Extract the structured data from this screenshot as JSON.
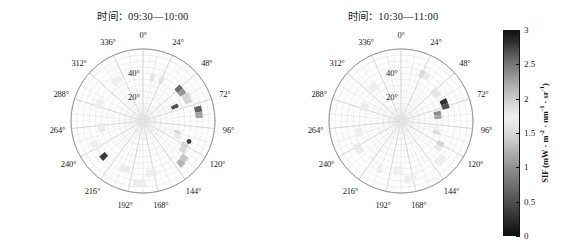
{
  "figure": {
    "background": "#ffffff",
    "panels": [
      {
        "id": "left",
        "title": "时间：09:30—10:00",
        "radial": {
          "labels": [
            "20°",
            "40°"
          ],
          "values": [
            20,
            40
          ],
          "max": 60,
          "rings": [
            5,
            10,
            15,
            20,
            25,
            30,
            35,
            40,
            45,
            50,
            55,
            60
          ]
        },
        "azimuth": {
          "labels": [
            "0°",
            "24°",
            "48°",
            "72°",
            "96°",
            "120°",
            "144°",
            "168°",
            "192°",
            "216°",
            "240°",
            "264°",
            "288°",
            "312°",
            "336°"
          ],
          "values": [
            0,
            24,
            48,
            72,
            96,
            120,
            144,
            168,
            192,
            216,
            240,
            264,
            288,
            312,
            336
          ],
          "spoke_step": 12
        },
        "marker": {
          "name": "hotspot-marker",
          "azimuth": 114,
          "zenith": 42,
          "color": "#404040"
        },
        "cells": [
          {
            "azimuth": 12,
            "zenith": 37,
            "value": 1.45
          },
          {
            "azimuth": 24,
            "zenith": 37,
            "value": 1.45
          },
          {
            "azimuth": 48,
            "zenith": 40,
            "value": 2.55
          },
          {
            "azimuth": 54,
            "zenith": 40,
            "value": 2.35
          },
          {
            "azimuth": 60,
            "zenith": 41,
            "value": 1.95
          },
          {
            "azimuth": 66,
            "zenith": 41,
            "value": 1.95
          },
          {
            "azimuth": 66,
            "zenith": 29,
            "value": 2.7
          },
          {
            "azimuth": 72,
            "zenith": 29,
            "value": 1.7
          },
          {
            "azimuth": 78,
            "zenith": 47,
            "value": 2.6
          },
          {
            "azimuth": 84,
            "zenith": 47,
            "value": 2.25
          },
          {
            "azimuth": 108,
            "zenith": 30,
            "value": 1.25
          },
          {
            "azimuth": 114,
            "zenith": 31,
            "value": 1.55
          },
          {
            "azimuth": 120,
            "zenith": 40,
            "value": 1.15
          },
          {
            "azimuth": 126,
            "zenith": 41,
            "value": 1.25
          },
          {
            "azimuth": 132,
            "zenith": 46,
            "value": 2.05
          },
          {
            "azimuth": 138,
            "zenith": 47,
            "value": 2.15
          },
          {
            "azimuth": 168,
            "zenith": 44,
            "value": 1.7
          },
          {
            "azimuth": 174,
            "zenith": 44,
            "value": 1.7
          },
          {
            "azimuth": 180,
            "zenith": 52,
            "value": 1.75
          },
          {
            "azimuth": 186,
            "zenith": 52,
            "value": 1.75
          },
          {
            "azimuth": 198,
            "zenith": 42,
            "value": 1.75
          },
          {
            "azimuth": 204,
            "zenith": 43,
            "value": 1.75
          },
          {
            "azimuth": 228,
            "zenith": 44,
            "value": 2.8
          },
          {
            "azimuth": 240,
            "zenith": 44,
            "value": 1.7
          },
          {
            "azimuth": 246,
            "zenith": 45,
            "value": 1.7
          },
          {
            "azimuth": 258,
            "zenith": 35,
            "value": 1.55
          },
          {
            "azimuth": 264,
            "zenith": 35,
            "value": 1.55
          },
          {
            "azimuth": 288,
            "zenith": 39,
            "value": 1.7
          },
          {
            "azimuth": 294,
            "zenith": 39,
            "value": 1.7
          },
          {
            "azimuth": 324,
            "zenith": 40,
            "value": 1.7
          },
          {
            "azimuth": 330,
            "zenith": 40,
            "value": 1.7
          }
        ]
      },
      {
        "id": "right",
        "title": "时间：10:30—11:00",
        "radial": {
          "labels": [
            "20°",
            "40°"
          ],
          "values": [
            20,
            40
          ],
          "max": 60,
          "rings": [
            5,
            10,
            15,
            20,
            25,
            30,
            35,
            40,
            45,
            50,
            55,
            60
          ]
        },
        "azimuth": {
          "labels": [
            "0°",
            "24°",
            "48°",
            "72°",
            "96°",
            "120°",
            "144°",
            "168°",
            "192°",
            "216°",
            "240°",
            "264°",
            "288°",
            "312°",
            "336°"
          ],
          "values": [
            0,
            24,
            48,
            72,
            96,
            120,
            144,
            168,
            192,
            216,
            240,
            264,
            288,
            312,
            336
          ],
          "spoke_step": 12
        },
        "marker": null,
        "cells": [
          {
            "azimuth": 24,
            "zenith": 43,
            "value": 1.9
          },
          {
            "azimuth": 30,
            "zenith": 43,
            "value": 1.55
          },
          {
            "azimuth": 48,
            "zenith": 37,
            "value": 1.45
          },
          {
            "azimuth": 54,
            "zenith": 37,
            "value": 1.45
          },
          {
            "azimuth": 66,
            "zenith": 39,
            "value": 2.85
          },
          {
            "azimuth": 72,
            "zenith": 39,
            "value": 2.7
          },
          {
            "azimuth": 78,
            "zenith": 31,
            "value": 2.4
          },
          {
            "azimuth": 84,
            "zenith": 31,
            "value": 2.25
          },
          {
            "azimuth": 102,
            "zenith": 30,
            "value": 1.65
          },
          {
            "azimuth": 108,
            "zenith": 31,
            "value": 1.9
          },
          {
            "azimuth": 120,
            "zenith": 38,
            "value": 1.2
          },
          {
            "azimuth": 126,
            "zenith": 38,
            "value": 1.55
          },
          {
            "azimuth": 132,
            "zenith": 46,
            "value": 1.7
          },
          {
            "azimuth": 138,
            "zenith": 46,
            "value": 1.7
          },
          {
            "azimuth": 168,
            "zenith": 49,
            "value": 1.7
          },
          {
            "azimuth": 174,
            "zenith": 49,
            "value": 1.7
          },
          {
            "azimuth": 180,
            "zenith": 41,
            "value": 1.7
          },
          {
            "azimuth": 186,
            "zenith": 41,
            "value": 1.7
          },
          {
            "azimuth": 204,
            "zenith": 44,
            "value": 1.7
          },
          {
            "azimuth": 234,
            "zenith": 42,
            "value": 1.7
          },
          {
            "azimuth": 240,
            "zenith": 42,
            "value": 1.55
          },
          {
            "azimuth": 252,
            "zenith": 36,
            "value": 1.7
          },
          {
            "azimuth": 258,
            "zenith": 36,
            "value": 1.7
          },
          {
            "azimuth": 288,
            "zenith": 33,
            "value": 1.55
          },
          {
            "azimuth": 294,
            "zenith": 33,
            "value": 1.55
          },
          {
            "azimuth": 318,
            "zenith": 36,
            "value": 1.7
          },
          {
            "azimuth": 324,
            "zenith": 36,
            "value": 1.7
          }
        ]
      }
    ]
  },
  "colorbar": {
    "name": "sif-colorbar",
    "label": "SIF (mW · m",
    "label_full": "SIF (mW · m-2 · nm-1 · sr-1)",
    "sup1": "-2",
    "mid1": " · nm",
    "sup2": "-1",
    "mid2": " · sr",
    "sup3": "-1",
    "tail": ")",
    "min": 0,
    "max": 3,
    "ticks": [
      "3",
      "2.5",
      "2",
      "1.5",
      "1",
      "0.5",
      "0"
    ],
    "tick_values": [
      3,
      2.5,
      2,
      1.5,
      1,
      0.5,
      0
    ]
  },
  "chart_data": {
    "type": "polar-heatmap",
    "subtitle": "",
    "xlabel": "Relative azimuth angle (°)",
    "ylabel": "Viewing zenith angle (°)",
    "colorbar_label": "SIF (mW · m-2 · nm-1 · sr-1)",
    "colorbar_range": [
      0,
      3
    ],
    "colorbar_ticks": [
      0,
      0.5,
      1,
      1.5,
      2,
      2.5,
      3
    ],
    "colormap": "grayscale",
    "grid": true,
    "legend_position": "right",
    "radial_range": [
      0,
      60
    ],
    "radial_ticks": [
      20,
      40
    ],
    "azimuth_ticks": [
      0,
      24,
      48,
      72,
      96,
      120,
      144,
      168,
      192,
      216,
      240,
      264,
      288,
      312,
      336
    ],
    "panels": [
      {
        "title": "时间：09:30—10:00",
        "points": [
          {
            "azimuth": 12,
            "zenith": 37,
            "sif": 1.45
          },
          {
            "azimuth": 24,
            "zenith": 37,
            "sif": 1.45
          },
          {
            "azimuth": 48,
            "zenith": 40,
            "sif": 2.55
          },
          {
            "azimuth": 54,
            "zenith": 40,
            "sif": 2.35
          },
          {
            "azimuth": 60,
            "zenith": 41,
            "sif": 1.95
          },
          {
            "azimuth": 66,
            "zenith": 41,
            "sif": 1.95
          },
          {
            "azimuth": 66,
            "zenith": 29,
            "sif": 2.7
          },
          {
            "azimuth": 72,
            "zenith": 29,
            "sif": 1.7
          },
          {
            "azimuth": 78,
            "zenith": 47,
            "sif": 2.6
          },
          {
            "azimuth": 84,
            "zenith": 47,
            "sif": 2.25
          },
          {
            "azimuth": 108,
            "zenith": 30,
            "sif": 1.25
          },
          {
            "azimuth": 114,
            "zenith": 31,
            "sif": 1.55
          },
          {
            "azimuth": 120,
            "zenith": 40,
            "sif": 1.15
          },
          {
            "azimuth": 126,
            "zenith": 41,
            "sif": 1.25
          },
          {
            "azimuth": 132,
            "zenith": 46,
            "sif": 2.05
          },
          {
            "azimuth": 138,
            "zenith": 47,
            "sif": 2.15
          },
          {
            "azimuth": 168,
            "zenith": 44,
            "sif": 1.7
          },
          {
            "azimuth": 180,
            "zenith": 52,
            "sif": 1.75
          },
          {
            "azimuth": 198,
            "zenith": 42,
            "sif": 1.75
          },
          {
            "azimuth": 228,
            "zenith": 44,
            "sif": 2.8
          },
          {
            "azimuth": 240,
            "zenith": 44,
            "sif": 1.7
          },
          {
            "azimuth": 258,
            "zenith": 35,
            "sif": 1.55
          },
          {
            "azimuth": 288,
            "zenith": 39,
            "sif": 1.7
          },
          {
            "azimuth": 324,
            "zenith": 40,
            "sif": 1.7
          }
        ],
        "marker": {
          "azimuth": 114,
          "zenith": 42,
          "type": "hotspot"
        }
      },
      {
        "title": "时间：10:30—11:00",
        "points": [
          {
            "azimuth": 24,
            "zenith": 43,
            "sif": 1.9
          },
          {
            "azimuth": 30,
            "zenith": 43,
            "sif": 1.55
          },
          {
            "azimuth": 48,
            "zenith": 37,
            "sif": 1.45
          },
          {
            "azimuth": 66,
            "zenith": 39,
            "sif": 2.85
          },
          {
            "azimuth": 72,
            "zenith": 39,
            "sif": 2.7
          },
          {
            "azimuth": 78,
            "zenith": 31,
            "sif": 2.4
          },
          {
            "azimuth": 84,
            "zenith": 31,
            "sif": 2.25
          },
          {
            "azimuth": 102,
            "zenith": 30,
            "sif": 1.65
          },
          {
            "azimuth": 108,
            "zenith": 31,
            "sif": 1.9
          },
          {
            "azimuth": 120,
            "zenith": 38,
            "sif": 1.2
          },
          {
            "azimuth": 126,
            "zenith": 38,
            "sif": 1.55
          },
          {
            "azimuth": 132,
            "zenith": 46,
            "sif": 1.7
          },
          {
            "azimuth": 168,
            "zenith": 49,
            "sif": 1.7
          },
          {
            "azimuth": 180,
            "zenith": 41,
            "sif": 1.7
          },
          {
            "azimuth": 204,
            "zenith": 44,
            "sif": 1.7
          },
          {
            "azimuth": 234,
            "zenith": 42,
            "sif": 1.7
          },
          {
            "azimuth": 252,
            "zenith": 36,
            "sif": 1.7
          },
          {
            "azimuth": 288,
            "zenith": 33,
            "sif": 1.55
          },
          {
            "azimuth": 318,
            "zenith": 36,
            "sif": 1.7
          }
        ],
        "marker": null
      }
    ]
  }
}
